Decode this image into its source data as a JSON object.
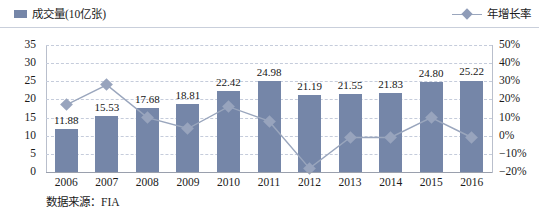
{
  "legend": {
    "bar_series_label": "成交量(10亿张)",
    "line_series_label": "年增长率",
    "bar_swatch_icon": "square-swatch-icon",
    "line_marker_icon": "diamond-marker-icon"
  },
  "footer": {
    "source_text": "数据来源：FIA"
  },
  "axes": {
    "left_ticks": [
      "35",
      "30",
      "25",
      "20",
      "15",
      "10",
      "5",
      "0"
    ],
    "right_ticks": [
      "50%",
      "40%",
      "30%",
      "20%",
      "10%",
      "0%",
      "−10%",
      "−20%"
    ]
  },
  "colors": {
    "bar": "#7586a8",
    "line": "#9aa6bd",
    "marker": "#98a4bd",
    "grid": "#c5ccdb",
    "axis": "#9aa0ad"
  },
  "chart_data": {
    "type": "bar",
    "title": "",
    "subtitle": "",
    "xlabel": "",
    "ylabel": "成交量(10亿张)",
    "y2label": "年增长率",
    "grid": true,
    "legend_position": "top",
    "categories": [
      "2006",
      "2007",
      "2008",
      "2009",
      "2010",
      "2011",
      "2012",
      "2013",
      "2014",
      "2015",
      "2016"
    ],
    "ylim": [
      0,
      35
    ],
    "y2lim": [
      -20,
      50
    ],
    "yticks": [
      0,
      5,
      10,
      15,
      20,
      25,
      30,
      35
    ],
    "y2ticks": [
      -20,
      -10,
      0,
      10,
      20,
      30,
      40,
      50
    ],
    "series": [
      {
        "name": "成交量(10亿张)",
        "type": "bar",
        "axis": "left",
        "unit": "10亿张",
        "values": [
          11.88,
          15.53,
          17.68,
          18.81,
          22.42,
          24.98,
          21.19,
          21.55,
          21.83,
          24.8,
          25.22
        ],
        "labels": [
          "11.88",
          "15.53",
          "17.68",
          "18.81",
          "22.42",
          "24.98",
          "21.19",
          "21.55",
          "21.83",
          "24.80",
          "25.22"
        ]
      },
      {
        "name": "年增长率",
        "type": "line",
        "axis": "right",
        "unit": "%",
        "values": [
          17,
          28,
          10,
          4,
          16,
          8,
          -18,
          -1,
          -1,
          10,
          -1
        ]
      }
    ]
  }
}
